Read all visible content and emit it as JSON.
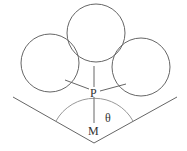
{
  "diagram": {
    "labels": {
      "p": "P",
      "m": "M",
      "theta": "θ"
    },
    "colors": {
      "stroke": "#666666",
      "arc": "#999999",
      "text": "#333333"
    }
  }
}
